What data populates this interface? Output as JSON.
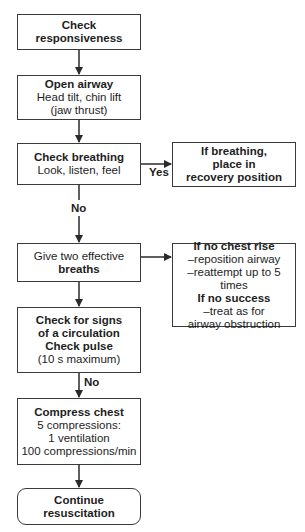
{
  "flowchart": {
    "nodes": {
      "check_responsiveness": {
        "title": "Check responsiveness"
      },
      "open_airway": {
        "title": "Open airway",
        "lines": [
          "Head tilt, chin lift",
          "(jaw thrust)"
        ]
      },
      "check_breathing": {
        "title": "Check breathing",
        "lines": [
          "Look, listen, feel"
        ]
      },
      "recovery": {
        "lines": [
          "If breathing,",
          "place in",
          "recovery position"
        ]
      },
      "give_breaths": {
        "line1": "Give two effective",
        "title": "breaths"
      },
      "no_chest_rise": {
        "title1": "If no chest rise",
        "lines1": [
          "–reposition airway",
          "–reattempt up to 5 times"
        ],
        "title2": "If no success",
        "lines2": [
          "–treat as for",
          "airway obstruction"
        ]
      },
      "check_circulation": {
        "titles": [
          "Check for signs",
          "of a circulation",
          "Check pulse"
        ],
        "lines": [
          "(10 s maximum)"
        ]
      },
      "compress_chest": {
        "title": "Compress chest",
        "lines": [
          "5 compressions:",
          "1 ventilation",
          "100 compressions/min"
        ]
      },
      "continue": {
        "lines": [
          "Continue",
          "resuscitation"
        ]
      }
    },
    "edge_labels": {
      "yes": "Yes",
      "no_breathing": "No",
      "no_pulse": "No"
    }
  }
}
